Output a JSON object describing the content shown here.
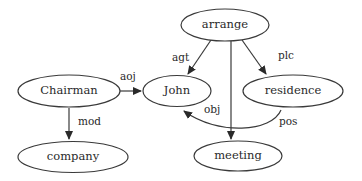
{
  "diagram": {
    "type": "semantic-network",
    "nodes": [
      {
        "id": "arrange",
        "label": "arrange",
        "cx": 225,
        "cy": 25,
        "rx": 44,
        "ry": 16
      },
      {
        "id": "chairman",
        "label": "Chairman",
        "cx": 69,
        "cy": 91,
        "rx": 51,
        "ry": 16
      },
      {
        "id": "john",
        "label": "John",
        "cx": 177,
        "cy": 91,
        "rx": 34,
        "ry": 15.5
      },
      {
        "id": "residence",
        "label": "residence",
        "cx": 293,
        "cy": 91,
        "rx": 50,
        "ry": 16
      },
      {
        "id": "company",
        "label": "company",
        "cx": 73,
        "cy": 157,
        "rx": 55,
        "ry": 15.5
      },
      {
        "id": "meeting",
        "label": "meeting",
        "cx": 238,
        "cy": 156,
        "rx": 44,
        "ry": 15
      }
    ],
    "edges": [
      {
        "id": "agt",
        "label": "agt",
        "from": "arrange",
        "to": "john"
      },
      {
        "id": "plc",
        "label": "plc",
        "from": "arrange",
        "to": "residence"
      },
      {
        "id": "obj",
        "label": "obj",
        "from": "arrange",
        "to": "meeting"
      },
      {
        "id": "aoj",
        "label": "aoj",
        "from": "chairman",
        "to": "john"
      },
      {
        "id": "mod",
        "label": "mod",
        "from": "chairman",
        "to": "company"
      },
      {
        "id": "pos",
        "label": "pos",
        "from": "residence",
        "to": "john"
      }
    ]
  },
  "labels": {
    "arrange": "arrange",
    "chairman": "Chairman",
    "john": "John",
    "residence": "residence",
    "company": "company",
    "meeting": "meeting",
    "agt": "agt",
    "plc": "plc",
    "obj": "obj",
    "aoj": "aoj",
    "mod": "mod",
    "pos": "pos"
  },
  "colors": {
    "stroke": "#3a3a3a",
    "text": "#2a2a2a",
    "background": "#ffffff"
  }
}
